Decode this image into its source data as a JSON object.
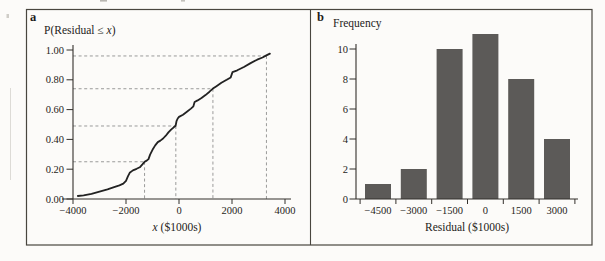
{
  "colors": {
    "paper": "#fcfbf9",
    "frame_border": "#49463f",
    "axis": "#33302c",
    "curve": "#222222",
    "dashed_guide": "#8e8e8e",
    "bar_fill": "#5c5a58",
    "text": "#1e1c1a"
  },
  "panels": {
    "a": {
      "label": "a",
      "ylabel_pre": "P(Residual ≤ ",
      "ylabel_var": "x",
      "ylabel_post": ")",
      "xlabel_var": "x",
      "xlabel_post": " ($1000s)"
    },
    "b": {
      "label": "b",
      "ylabel": "Frequency",
      "xlabel": "Residual ($1000s)"
    }
  },
  "chart_data": [
    {
      "type": "line",
      "panel": "a",
      "title": "",
      "ylabel": "P(Residual ≤ x)",
      "xlabel": "x ($1000s)",
      "xlim": [
        -4000,
        4000
      ],
      "ylim": [
        0,
        1
      ],
      "grid": false,
      "legend": false,
      "xticks": [
        {
          "v": -4000,
          "label": "−4000"
        },
        {
          "v": -2000,
          "label": "−2000"
        },
        {
          "v": 0,
          "label": "0"
        },
        {
          "v": 2000,
          "label": "2000"
        },
        {
          "v": 4000,
          "label": "4000"
        }
      ],
      "yticks": [
        {
          "v": 0.0,
          "label": "0.00"
        },
        {
          "v": 0.2,
          "label": "0.20"
        },
        {
          "v": 0.4,
          "label": "0.40"
        },
        {
          "v": 0.6,
          "label": "0.60"
        },
        {
          "v": 0.8,
          "label": "0.80"
        },
        {
          "v": 1.0,
          "label": "1.00"
        }
      ],
      "percentile_guides": [
        {
          "p": 0.25,
          "x": -1300
        },
        {
          "p": 0.49,
          "x": -120
        },
        {
          "p": 0.74,
          "x": 1280
        },
        {
          "p": 0.96,
          "x": 3300
        }
      ],
      "points": [
        [
          -3820,
          0.02
        ],
        [
          -3600,
          0.025
        ],
        [
          -3300,
          0.035
        ],
        [
          -3000,
          0.05
        ],
        [
          -2700,
          0.065
        ],
        [
          -2450,
          0.08
        ],
        [
          -2250,
          0.092
        ],
        [
          -2100,
          0.103
        ],
        [
          -2000,
          0.122
        ],
        [
          -1930,
          0.152
        ],
        [
          -1860,
          0.176
        ],
        [
          -1740,
          0.192
        ],
        [
          -1600,
          0.203
        ],
        [
          -1480,
          0.213
        ],
        [
          -1380,
          0.232
        ],
        [
          -1300,
          0.25
        ],
        [
          -1220,
          0.258
        ],
        [
          -1150,
          0.268
        ],
        [
          -1090,
          0.298
        ],
        [
          -1000,
          0.33
        ],
        [
          -900,
          0.36
        ],
        [
          -800,
          0.382
        ],
        [
          -700,
          0.392
        ],
        [
          -600,
          0.406
        ],
        [
          -500,
          0.425
        ],
        [
          -400,
          0.447
        ],
        [
          -300,
          0.466
        ],
        [
          -200,
          0.481
        ],
        [
          -130,
          0.492
        ],
        [
          -95,
          0.522
        ],
        [
          -50,
          0.54
        ],
        [
          0,
          0.551
        ],
        [
          150,
          0.566
        ],
        [
          300,
          0.586
        ],
        [
          450,
          0.607
        ],
        [
          545,
          0.622
        ],
        [
          590,
          0.651
        ],
        [
          700,
          0.662
        ],
        [
          850,
          0.678
        ],
        [
          1000,
          0.697
        ],
        [
          1150,
          0.72
        ],
        [
          1280,
          0.741
        ],
        [
          1400,
          0.756
        ],
        [
          1600,
          0.78
        ],
        [
          1800,
          0.8
        ],
        [
          1950,
          0.816
        ],
        [
          2020,
          0.852
        ],
        [
          2200,
          0.864
        ],
        [
          2450,
          0.886
        ],
        [
          2700,
          0.912
        ],
        [
          2950,
          0.935
        ],
        [
          3150,
          0.95
        ],
        [
          3300,
          0.964
        ],
        [
          3430,
          0.976
        ]
      ]
    },
    {
      "type": "bar",
      "panel": "b",
      "title": "",
      "ylabel": "Frequency",
      "xlabel": "Residual ($1000s)",
      "categories": [
        -4500,
        -3000,
        -1500,
        0,
        1500,
        3000
      ],
      "category_labels": [
        "−4500",
        "−3000",
        "−1500",
        "0",
        "1500",
        "3000"
      ],
      "values": [
        1,
        2,
        10,
        11,
        8,
        4
      ],
      "yticks": [
        0,
        2,
        4,
        6,
        8,
        10
      ],
      "ylim": [
        0,
        11.5
      ],
      "grid": false,
      "legend": false
    }
  ]
}
